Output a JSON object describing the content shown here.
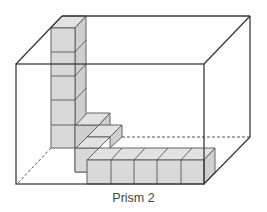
{
  "figure": {
    "caption": "Prism 2",
    "colors": {
      "cube_fill": "#d9d9d9",
      "edge": "#3a3a3a",
      "background": "#ffffff"
    }
  }
}
